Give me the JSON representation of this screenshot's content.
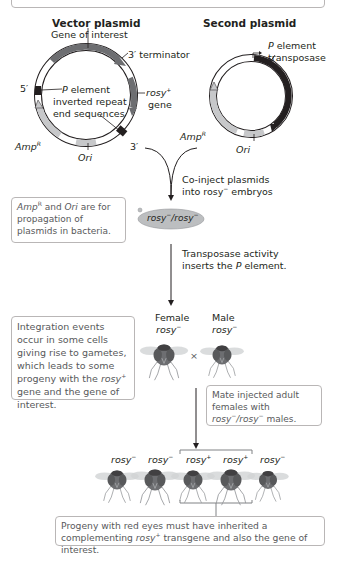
{
  "top_box": {
    "text": ""
  },
  "vector_plasmid": {
    "title": "Vector plasmid",
    "gene_of_interest": "Gene of interest",
    "terminator": "3′ terminator",
    "five_prime": "5′",
    "three_prime": "3′",
    "p_element_line1_p": "P",
    "p_element_line1_rest": " element",
    "p_element_line2": "inverted repeat",
    "p_element_line3": "end sequences",
    "rosy_label": "rosy",
    "rosy_sup": "+",
    "rosy_gene": "gene",
    "amp_label": "Amp",
    "amp_sup": "R",
    "ori_label": "Ori"
  },
  "second_plasmid": {
    "title": "Second plasmid",
    "transposase_p": "P",
    "transposase_line1_rest": " element",
    "transposase_line2": "transposase",
    "amp_label": "Amp",
    "amp_sup": "R",
    "ori_label": "Ori"
  },
  "steps": {
    "coinject_line1": "Co-inject plasmids",
    "coinject_line2_a": "into rosy",
    "coinject_line2_sup": "−",
    "coinject_line2_b": " embryos",
    "embryo_label_a": "rosy",
    "embryo_label_sup1": "−",
    "embryo_label_b": "/rosy",
    "embryo_label_sup2": "−",
    "transposase_line1": "Transposase activity",
    "transposase_line2_a": "inserts the ",
    "transposase_line2_p": "P",
    "transposase_line2_b": " element."
  },
  "notes": {
    "amp_ori_a": "Amp",
    "amp_ori_sup": "R",
    "amp_ori_b": " and ",
    "amp_ori_ori": "Ori",
    "amp_ori_c": " are for propagation of plasmids in bacteria.",
    "integration_a": "Integration events occur in some cells giving rise to gametes, which leads to some progeny with the ",
    "integration_rosy": "rosy",
    "integration_sup": "+",
    "integration_b": " gene and the gene of interest.",
    "mate_a": "Mate injected adult females with ",
    "mate_rosy1": "rosy",
    "mate_sup1": "−",
    "mate_slash": "/",
    "mate_rosy2": "rosy",
    "mate_sup2": "−",
    "mate_b": " males.",
    "progeny_a": "Progeny with red eyes must have inherited a complementing ",
    "progeny_rosy": "rosy",
    "progeny_sup": "+",
    "progeny_b": " transgene and also the gene of interest."
  },
  "parents": {
    "female_label": "Female",
    "male_label": "Male",
    "genotype": "rosy",
    "genotype_sup": "−",
    "cross_symbol": "×"
  },
  "progeny": [
    {
      "genotype": "rosy",
      "sup": "−"
    },
    {
      "genotype": "rosy",
      "sup": "−"
    },
    {
      "genotype": "rosy",
      "sup": "+"
    },
    {
      "genotype": "rosy",
      "sup": "+"
    },
    {
      "genotype": "rosy",
      "sup": "−"
    }
  ],
  "colors": {
    "gene_dark": "#6d6e71",
    "amp_light": "#c7c8ca",
    "p_end_black": "#231f20",
    "embryo": "#bcbec0",
    "note_border": "#b9b6b6"
  }
}
